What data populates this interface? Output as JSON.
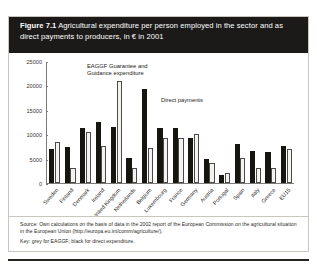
{
  "figure": {
    "number": "Figure 7.1",
    "title": "Agricultural expenditure per person employed in the sector and as direct payments to producers, in € in 2001"
  },
  "annotations": {
    "eaggf": "EAGGF Guarantee and\nGuidance expenditure",
    "direct": "Direct payments"
  },
  "footer": {
    "source": "Source: Own calculations on the basis of data in the 2002 report of the European Commission on the agricultural situation in the European Union (http://europa.eu.int/comm/agriculture/).",
    "key": "Key: grey for EAGGF; black for direct expenditure."
  },
  "colors": {
    "title_bar": "#1c1a18",
    "dark_bar": "#17150f",
    "light_bar": "#f4f3f0",
    "light_bar_border": "#4c4a46",
    "axis": "#7d7a76",
    "card_border": "#c9c6c0"
  },
  "chart_data": {
    "type": "bar",
    "title": "Agricultural expenditure per person employed in the sector and as direct payments to producers, in € in 2001",
    "xlabel": "",
    "ylabel": "",
    "ylim": [
      0,
      25000
    ],
    "yticks": [
      0,
      5000,
      10000,
      15000,
      20000,
      25000
    ],
    "ytick_labels": [
      "0",
      "5000",
      "10000",
      "15000",
      "20000",
      "25000"
    ],
    "grid": false,
    "legend_position": "inside-plot-annotations",
    "categories": [
      "Sweden",
      "Finland",
      "Denmark",
      "Ireland",
      "United Kingdom",
      "Netherlands",
      "Belgium",
      "Luxembourg",
      "France",
      "Germany",
      "Austria",
      "Portugal",
      "Spain",
      "Italy",
      "Greece",
      "EU15"
    ],
    "series": [
      {
        "name": "Direct payments",
        "color": "#17150f",
        "values": [
          7000,
          7500,
          11400,
          12600,
          11500,
          5200,
          19400,
          11300,
          11300,
          9200,
          5000,
          1600,
          8000,
          6700,
          6400,
          7600
        ]
      },
      {
        "name": "EAGGF Guarantee and Guidance expenditure",
        "color": "#f4f3f0",
        "values": [
          8500,
          3200,
          10500,
          7600,
          21100,
          3000,
          7200,
          9200,
          9300,
          10100,
          4100,
          2100,
          5200,
          3100,
          3200,
          7100
        ]
      }
    ]
  }
}
